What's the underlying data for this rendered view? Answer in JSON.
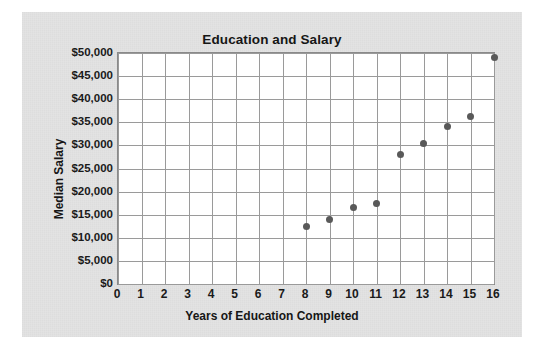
{
  "chart_data": {
    "type": "scatter",
    "title": "Education and Salary",
    "xlabel": "Years of Education Completed",
    "ylabel": "Median Salary",
    "xlim": [
      0,
      16
    ],
    "ylim": [
      0,
      50000
    ],
    "grid": true,
    "legend": null,
    "x_ticks": [
      "0",
      "1",
      "2",
      "3",
      "4",
      "5",
      "6",
      "7",
      "8",
      "9",
      "10",
      "11",
      "12",
      "13",
      "14",
      "15",
      "16"
    ],
    "x_tick_values": [
      0,
      1,
      2,
      3,
      4,
      5,
      6,
      7,
      8,
      9,
      10,
      11,
      12,
      13,
      14,
      15,
      16
    ],
    "y_ticks": [
      "$0",
      "$5,000",
      "$10,000",
      "$15,000",
      "$20,000",
      "$25,000",
      "$30,000",
      "$35,000",
      "$40,000",
      "$45,000",
      "$50,000"
    ],
    "y_tick_values": [
      0,
      5000,
      10000,
      15000,
      20000,
      25000,
      30000,
      35000,
      40000,
      45000,
      50000
    ],
    "x": [
      8,
      9,
      10,
      11,
      12,
      13,
      14,
      15,
      16
    ],
    "values": [
      12500,
      14000,
      16500,
      17500,
      28000,
      30500,
      34000,
      36200,
      49000
    ],
    "point_color": "#595959",
    "plot_background": "#ffffff",
    "grid_color": "#9a9a9a",
    "panel_background": "#e3e3e3"
  }
}
